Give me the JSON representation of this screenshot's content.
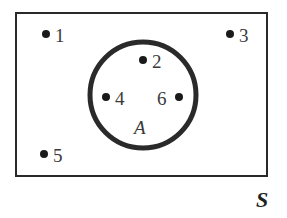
{
  "diagram": {
    "type": "venn",
    "universe": {
      "label": "S"
    },
    "set": {
      "label": "A",
      "members": [
        "2",
        "4",
        "6"
      ]
    },
    "points": [
      {
        "label": "1",
        "in_set": false
      },
      {
        "label": "2",
        "in_set": true
      },
      {
        "label": "3",
        "in_set": false
      },
      {
        "label": "4",
        "in_set": true
      },
      {
        "label": "5",
        "in_set": false
      },
      {
        "label": "6",
        "in_set": true
      }
    ],
    "colors": {
      "stroke": "#2a2a2a",
      "dot": "#1a1a1a",
      "text": "#3a3a3a",
      "background": "#ffffff"
    }
  }
}
